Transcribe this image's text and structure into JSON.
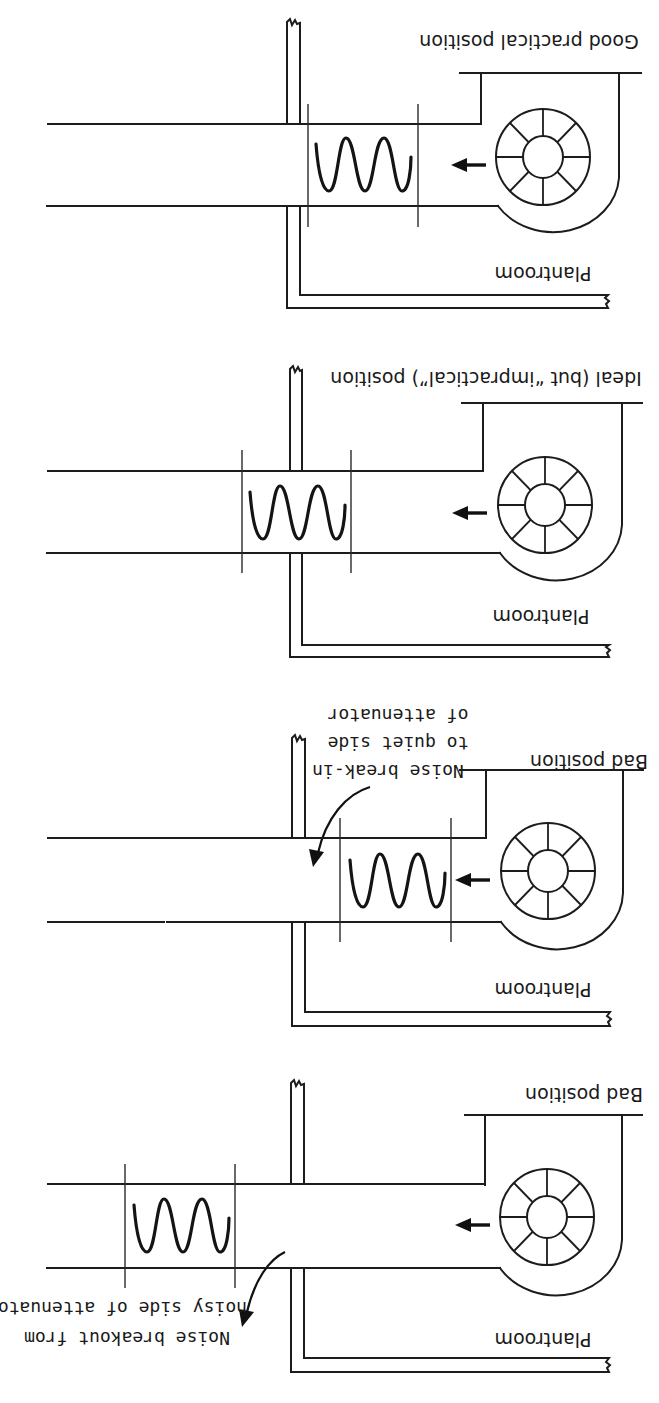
{
  "figure": {
    "orientation": "rotated-180",
    "panels": [
      {
        "id": "good-practical",
        "title": "Good practical position",
        "room_label": "Plantroom",
        "attenuator_location": "at wall, straddling plantroom partition (shown spanning wall on plantroom side)"
      },
      {
        "id": "ideal",
        "title": "Ideal (but “impractical”) position",
        "room_label": "Plantroom",
        "attenuator_location": "centred within wall penetration"
      },
      {
        "id": "bad-break-in",
        "title": "Bad position",
        "room_label": "Plantroom",
        "annotation_lines": [
          "Noise break-in",
          "to quiet side",
          "of attenuator"
        ]
      },
      {
        "id": "bad-breakout",
        "title": "Bad position",
        "room_label": "Plantroom",
        "annotation_lines": [
          "Noise breakout from",
          "noisy side of attenuator"
        ]
      }
    ]
  },
  "colors": {
    "ink": "#1c1c1c",
    "paper": "#ffffff"
  }
}
